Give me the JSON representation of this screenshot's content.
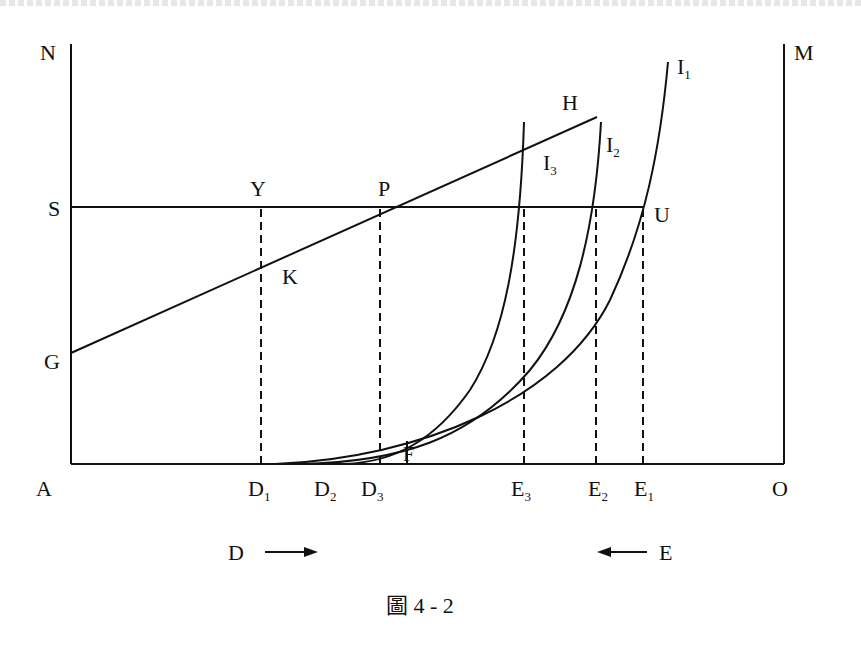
{
  "figure": {
    "caption": "圖 4 - 2",
    "axis_labels": {
      "top_left": "N",
      "top_right": "M",
      "bottom_left": "A",
      "bottom_right": "O"
    },
    "points": {
      "S": "S",
      "G": "G",
      "Y": "Y",
      "K": "K",
      "P": "P",
      "H": "H",
      "U": "U",
      "F": "F"
    },
    "curves": [
      {
        "name": "I",
        "sub": "1"
      },
      {
        "name": "I",
        "sub": "2"
      },
      {
        "name": "I",
        "sub": "3"
      }
    ],
    "baseline_marks": {
      "D1": {
        "name": "D",
        "sub": "1"
      },
      "D2": {
        "name": "D",
        "sub": "2"
      },
      "D3": {
        "name": "D",
        "sub": "3"
      },
      "E3": {
        "name": "E",
        "sub": "3"
      },
      "E2": {
        "name": "E",
        "sub": "2"
      },
      "E1": {
        "name": "E",
        "sub": "1"
      }
    },
    "direction_arrows": {
      "left": {
        "label": "D",
        "direction": "right"
      },
      "right": {
        "label": "E",
        "direction": "left"
      }
    }
  }
}
